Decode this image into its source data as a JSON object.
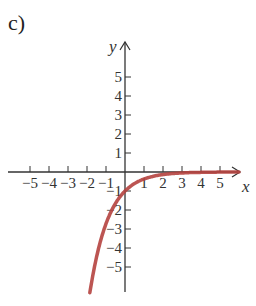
{
  "panel_label": "c)",
  "chart_data": {
    "type": "line",
    "title": "",
    "xlabel": "x",
    "ylabel": "y",
    "xlim": [
      -6,
      6
    ],
    "ylim": [
      -6,
      6
    ],
    "x_ticks": [
      -5,
      -4,
      -3,
      -2,
      -1,
      1,
      2,
      3,
      4,
      5
    ],
    "y_ticks": [
      -5,
      -4,
      -3,
      -2,
      -1,
      1,
      2,
      3,
      4,
      5
    ],
    "grid": false,
    "series": [
      {
        "name": "curve",
        "color": "#b5433f",
        "x": [
          -1.8,
          -1.5,
          -1.0,
          -0.5,
          0,
          0.5,
          1,
          1.5,
          2,
          3,
          4,
          5,
          6
        ],
        "y": [
          -6.05,
          -4.48,
          -2.72,
          -1.65,
          -1.0,
          -0.61,
          -0.37,
          -0.22,
          -0.14,
          -0.05,
          -0.02,
          -0.01,
          0.0
        ]
      }
    ]
  }
}
